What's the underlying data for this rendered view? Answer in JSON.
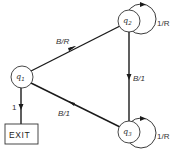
{
  "diagram": {
    "type": "state-transition-diagram",
    "states": [
      {
        "id": "q1",
        "letter": "q",
        "sub": "1"
      },
      {
        "id": "q2",
        "letter": "q",
        "sub": "2"
      },
      {
        "id": "q3",
        "letter": "q",
        "sub": "3"
      }
    ],
    "exit": {
      "label": "EXIT"
    },
    "transitions": [
      {
        "from": "q1",
        "to": "q2",
        "label": "B/R"
      },
      {
        "from": "q2",
        "to": "q3",
        "label": "B/1"
      },
      {
        "from": "q3",
        "to": "q1",
        "label": "B/1"
      },
      {
        "from": "q1",
        "to": "EXIT",
        "label": "1"
      },
      {
        "from": "q2",
        "to": "q2",
        "label": "1/R"
      },
      {
        "from": "q3",
        "to": "q3",
        "label": "1/R"
      }
    ],
    "colors": {
      "stroke": "#1a1a1a",
      "text": "#333333",
      "background": "#ffffff"
    }
  }
}
